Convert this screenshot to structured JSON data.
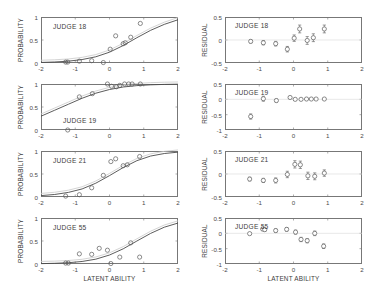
{
  "figure": {
    "axis_labels": {
      "x": "LATENT ABILITY",
      "y_left": "PROBABILITY",
      "y_right": "RESIDUAL"
    },
    "colors": {
      "axis": "#777777",
      "curve": "#4a4a4a",
      "ghost_curve": "#c9c9c9",
      "marker": "#5a5a5a",
      "text": "#3c3c3c"
    }
  },
  "chart_data": [
    {
      "type": "line",
      "panel": "left-1",
      "title": "JUDGE 18",
      "xlabel": "LATENT ABILITY",
      "ylabel": "PROBABILITY",
      "xlim": [
        -2,
        2
      ],
      "ylim": [
        0,
        1
      ],
      "xticks": [
        -2,
        -1,
        0,
        1,
        2
      ],
      "yticks": [
        0,
        0.5,
        1
      ],
      "grid": false,
      "series": [
        {
          "name": "fitted logistic curve",
          "type": "line",
          "x": [
            -2.0,
            -1.6,
            -1.2,
            -0.8,
            -0.4,
            0.0,
            0.4,
            0.8,
            1.2,
            1.6,
            2.0
          ],
          "y": [
            0.012,
            0.022,
            0.04,
            0.075,
            0.135,
            0.235,
            0.38,
            0.55,
            0.71,
            0.84,
            0.94
          ]
        },
        {
          "name": "observed proportions",
          "type": "scatter",
          "x": [
            -1.28,
            -1.22,
            -0.88,
            -0.52,
            -0.18,
            0.02,
            0.18,
            0.4,
            0.46,
            0.62,
            0.9
          ],
          "y": [
            0.02,
            0.02,
            0.04,
            0.05,
            0.01,
            0.3,
            0.59,
            0.42,
            0.44,
            0.56,
            0.86
          ]
        }
      ]
    },
    {
      "type": "scatter",
      "panel": "right-1",
      "title": "JUDGE 18",
      "xlabel": "LATENT ABILITY",
      "ylabel": "RESIDUAL",
      "xlim": [
        -2,
        2
      ],
      "ylim": [
        -0.5,
        0.5
      ],
      "xticks": [
        -2,
        -1,
        0,
        1,
        2
      ],
      "yticks": [
        -0.5,
        0,
        0.5
      ],
      "grid": false,
      "zero_line": true,
      "series": [
        {
          "name": "residuals with error bars",
          "type": "errorbar",
          "x": [
            -1.25,
            -0.88,
            -0.52,
            -0.18,
            0.02,
            0.18,
            0.4,
            0.58,
            0.9
          ],
          "y": [
            -0.03,
            -0.06,
            -0.08,
            -0.2,
            0.04,
            0.24,
            -0.01,
            0.05,
            0.24
          ],
          "yerr": [
            0.035,
            0.045,
            0.05,
            0.06,
            0.07,
            0.085,
            0.085,
            0.085,
            0.085
          ]
        }
      ]
    },
    {
      "type": "line",
      "panel": "left-2",
      "title": "JUDGE 19",
      "xlabel": "LATENT ABILITY",
      "ylabel": "PROBABILITY",
      "xlim": [
        -2,
        2
      ],
      "ylim": [
        0,
        1
      ],
      "xticks": [
        -2,
        -1,
        0,
        1,
        2
      ],
      "yticks": [
        0,
        0.5,
        1
      ],
      "grid": false,
      "series": [
        {
          "name": "fitted logistic curve",
          "type": "line",
          "x": [
            -2.0,
            -1.6,
            -1.2,
            -0.8,
            -0.4,
            0.0,
            0.4,
            0.8,
            1.2,
            1.6,
            2.0
          ],
          "y": [
            0.3,
            0.43,
            0.56,
            0.69,
            0.8,
            0.88,
            0.935,
            0.965,
            0.982,
            0.991,
            0.996
          ]
        },
        {
          "name": "observed proportions",
          "type": "scatter",
          "x": [
            -1.22,
            -0.88,
            -0.5,
            -0.06,
            0.06,
            0.2,
            0.3,
            0.44,
            0.56,
            0.66,
            0.9
          ],
          "y": [
            0.0,
            0.72,
            0.79,
            1.0,
            0.95,
            0.94,
            0.97,
            1.0,
            1.0,
            1.0,
            1.0
          ]
        }
      ]
    },
    {
      "type": "scatter",
      "panel": "right-2",
      "title": "JUDGE 19",
      "xlabel": "LATENT ABILITY",
      "ylabel": "RESIDUAL",
      "xlim": [
        -2,
        2
      ],
      "ylim": [
        -1,
        0.5
      ],
      "xticks": [
        -2,
        -1,
        0,
        1,
        2
      ],
      "yticks": [
        -1,
        -0.5,
        0,
        0.5
      ],
      "grid": false,
      "zero_line": true,
      "series": [
        {
          "name": "residuals with error bars",
          "type": "errorbar",
          "x": [
            -1.25,
            -0.88,
            -0.5,
            -0.1,
            0.05,
            0.22,
            0.38,
            0.52,
            0.66,
            0.9
          ],
          "y": [
            -0.56,
            0.02,
            -0.04,
            0.06,
            0.0,
            0.0,
            0.01,
            0.01,
            0.01,
            0.01
          ],
          "yerr": [
            0.085,
            0.08,
            0.05,
            0.035,
            0.03,
            0.025,
            0.022,
            0.02,
            0.018,
            0.016
          ]
        }
      ]
    },
    {
      "type": "line",
      "panel": "left-3",
      "title": "JUDGE 21",
      "xlabel": "LATENT ABILITY",
      "ylabel": "PROBABILITY",
      "xlim": [
        -2,
        2
      ],
      "ylim": [
        0,
        1
      ],
      "xticks": [
        -2,
        -1,
        0,
        1,
        2
      ],
      "yticks": [
        0,
        0.5,
        1
      ],
      "grid": false,
      "series": [
        {
          "name": "fitted logistic curve",
          "type": "line",
          "x": [
            -2.0,
            -1.6,
            -1.2,
            -0.8,
            -0.4,
            0.0,
            0.4,
            0.8,
            1.2,
            1.6,
            2.0
          ],
          "y": [
            0.03,
            0.055,
            0.1,
            0.175,
            0.3,
            0.465,
            0.64,
            0.79,
            0.89,
            0.945,
            0.975
          ]
        },
        {
          "name": "observed proportions",
          "type": "scatter",
          "x": [
            -1.28,
            -0.88,
            -0.52,
            -0.18,
            0.04,
            0.18,
            0.4,
            0.52,
            0.88
          ],
          "y": [
            0.02,
            0.05,
            0.2,
            0.47,
            0.77,
            0.83,
            0.68,
            0.7,
            0.88
          ]
        }
      ]
    },
    {
      "type": "scatter",
      "panel": "right-3",
      "title": "JUDGE 21",
      "xlabel": "LATENT ABILITY",
      "ylabel": "RESIDUAL",
      "xlim": [
        -2,
        2
      ],
      "ylim": [
        -0.5,
        0.5
      ],
      "xticks": [
        -2,
        -1,
        0,
        1,
        2
      ],
      "yticks": [
        -0.5,
        0,
        0.5
      ],
      "grid": false,
      "zero_line": true,
      "series": [
        {
          "name": "residuals with error bars",
          "type": "errorbar",
          "x": [
            -1.28,
            -0.88,
            -0.52,
            -0.18,
            0.04,
            0.2,
            0.42,
            0.62,
            0.9
          ],
          "y": [
            -0.11,
            -0.14,
            -0.14,
            -0.01,
            0.21,
            0.2,
            -0.04,
            -0.05,
            0.02
          ],
          "yerr": [
            0.04,
            0.045,
            0.055,
            0.07,
            0.08,
            0.08,
            0.08,
            0.075,
            0.07
          ]
        }
      ]
    },
    {
      "type": "line",
      "panel": "left-4",
      "title": "JUDGE 55",
      "xlabel": "LATENT ABILITY",
      "ylabel": "PROBABILITY",
      "xlim": [
        -2,
        2
      ],
      "ylim": [
        0,
        1
      ],
      "xticks": [
        -2,
        -1,
        0,
        1,
        2
      ],
      "yticks": [
        0,
        0.5,
        1
      ],
      "grid": false,
      "series": [
        {
          "name": "fitted logistic curve",
          "type": "line",
          "x": [
            -2.0,
            -1.6,
            -1.2,
            -0.8,
            -0.4,
            0.0,
            0.4,
            0.8,
            1.2,
            1.6,
            2.0
          ],
          "y": [
            0.008,
            0.015,
            0.028,
            0.055,
            0.105,
            0.195,
            0.33,
            0.5,
            0.665,
            0.8,
            0.89
          ]
        },
        {
          "name": "observed proportions",
          "type": "scatter",
          "x": [
            -1.28,
            -1.2,
            -0.88,
            -0.52,
            -0.3,
            -0.06,
            0.04,
            0.3,
            0.62,
            0.88
          ],
          "y": [
            0.02,
            0.02,
            0.22,
            0.21,
            0.34,
            0.3,
            0.01,
            0.15,
            0.46,
            0.15
          ]
        }
      ]
    },
    {
      "type": "scatter",
      "panel": "right-4",
      "title": "JUDGE 55",
      "xlabel": "LATENT ABILITY",
      "ylabel": "RESIDUAL",
      "xlim": [
        -2,
        2
      ],
      "ylim": [
        -1,
        0.5
      ],
      "xticks": [
        -2,
        -1,
        0,
        1,
        2
      ],
      "yticks": [
        -1,
        -0.5,
        0,
        0.5
      ],
      "grid": false,
      "zero_line": true,
      "series": [
        {
          "name": "residuals with error bars",
          "type": "errorbar",
          "x": [
            -1.28,
            -0.9,
            -0.84,
            -0.52,
            -0.2,
            0.06,
            0.22,
            0.4,
            0.62,
            0.88
          ],
          "y": [
            -0.01,
            0.14,
            0.12,
            0.09,
            0.13,
            0.04,
            -0.2,
            -0.24,
            0.0,
            -0.42
          ],
          "yerr": [
            0.03,
            0.05,
            0.05,
            0.055,
            0.06,
            0.065,
            0.07,
            0.07,
            0.075,
            0.075
          ]
        }
      ]
    }
  ]
}
